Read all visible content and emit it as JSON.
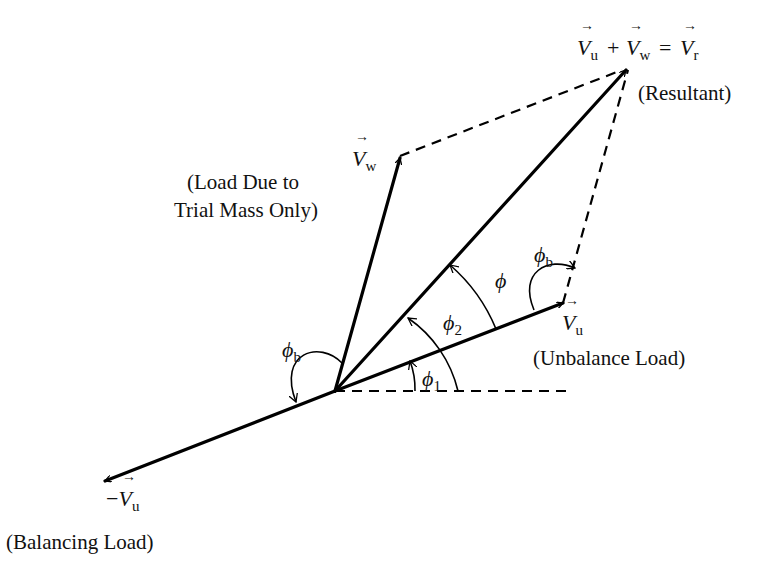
{
  "diagram": {
    "labels": {
      "resultant_equation": {
        "v1": "V",
        "s1": "u",
        "plus": "+",
        "v2": "V",
        "s2": "w",
        "eq": "=",
        "v3": "V",
        "s3": "r"
      },
      "resultant_desc": "(Resultant)",
      "vw_symbol": "V",
      "vw_sub": "w",
      "vw_desc_line1": "(Load Due to",
      "vw_desc_line2": "Trial Mass Only)",
      "vu_symbol": "V",
      "vu_sub": "u",
      "vu_desc": "(Unbalance Load)",
      "neg_vu_minus": "−",
      "neg_vu_symbol": "V",
      "neg_vu_sub": "u",
      "neg_vu_desc": "(Balancing Load)",
      "phi": "ϕ",
      "phi1_sub": "1",
      "phi2_sub": "2",
      "phib_sub": "b"
    },
    "vectors": [
      {
        "name": "V_u",
        "meaning": "Unbalance Load"
      },
      {
        "name": "V_w",
        "meaning": "Load Due to Trial Mass Only"
      },
      {
        "name": "V_r",
        "meaning": "Resultant"
      },
      {
        "name": "-V_u",
        "meaning": "Balancing Load"
      }
    ],
    "angles": [
      "phi_1",
      "phi_2",
      "phi",
      "phi_b"
    ]
  }
}
